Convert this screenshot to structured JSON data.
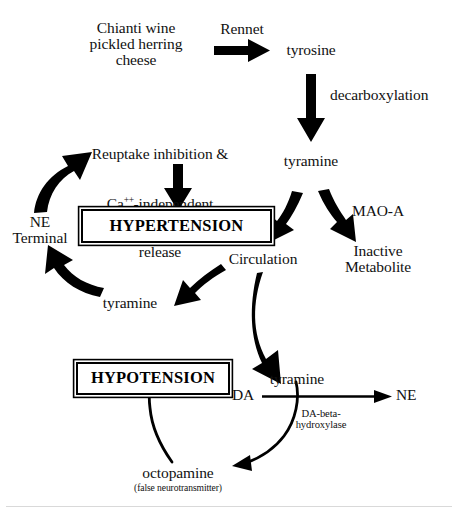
{
  "diagram": {
    "ink_color": "#000000",
    "background_color": "#ffffff",
    "nodes": {
      "foods": "Chianti wine\npickled herring\ncheese",
      "tyrosine": "tyrosine",
      "tyramine_gut": "tyramine",
      "inactive_metabolite": "Inactive\nMetabolite",
      "reuptake": "Reuptake inhibition &",
      "reuptake_line2_prefix": "Ca",
      "reuptake_line2_sup": "++",
      "reuptake_line2_suffix": "-independent",
      "reuptake_line3": "release",
      "ne_terminal": "NE\nTerminal",
      "hypertension": "HYPERTENSION",
      "circulation": "Circulation",
      "tyramine_terminal": "tyramine",
      "hypotension": "HYPOTENSION",
      "tyramine_lower": "tyramine",
      "da": "DA",
      "ne": "NE",
      "octopamine": "octopamine",
      "octopamine_note": "(false neurotransmitter)"
    },
    "edge_labels": {
      "rennet": "Rennet",
      "decarboxylation": "decarboxylation",
      "mao_a": "MAO-A",
      "da_beta_hydroxylase": "DA-beta-\nhydroxylase"
    }
  }
}
